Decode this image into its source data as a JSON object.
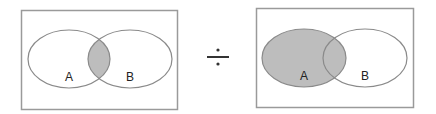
{
  "diagram": {
    "type": "venn-equation",
    "operator": "÷",
    "left_panel": {
      "sets": [
        {
          "label": "A",
          "cx": 69,
          "cy": 59,
          "rx": 41,
          "ry": 29
        },
        {
          "label": "B",
          "cx": 130,
          "cy": 59,
          "rx": 42,
          "ry": 29
        }
      ],
      "shaded_region": "A ∩ B"
    },
    "right_panel": {
      "sets": [
        {
          "label": "A",
          "cx": 304,
          "cy": 58,
          "rx": 42,
          "ry": 29
        },
        {
          "label": "B",
          "cx": 365,
          "cy": 58,
          "rx": 42,
          "ry": 29
        }
      ],
      "shaded_region": "A"
    },
    "colors": {
      "shade": "#bdbdbd",
      "stroke": "#8a8a8a",
      "frame": "#9a9a9a",
      "operator": "#333333"
    }
  }
}
